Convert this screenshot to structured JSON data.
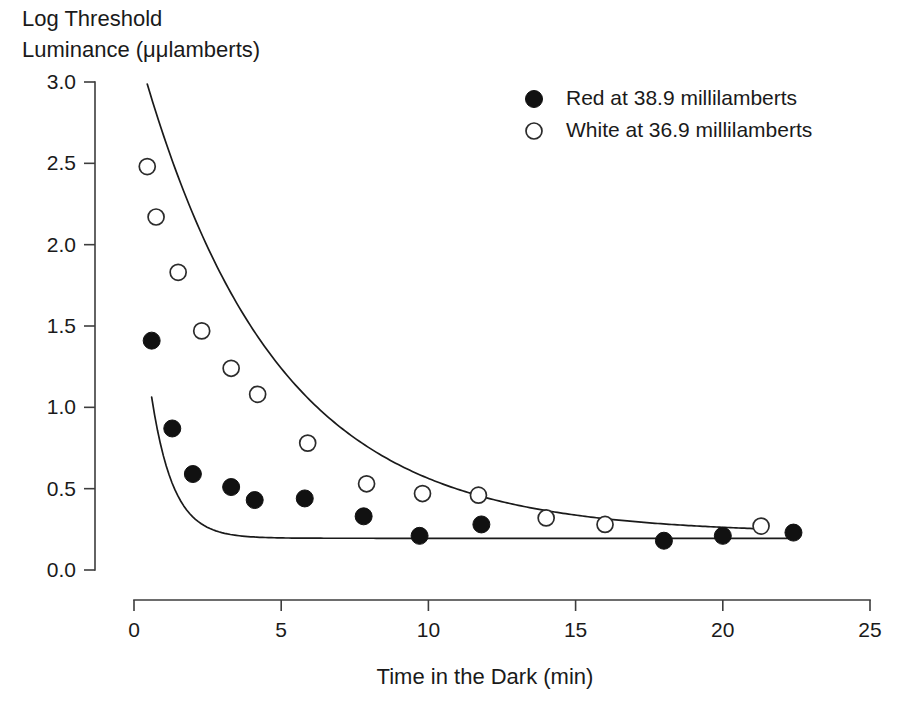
{
  "chart_data": {
    "type": "scatter",
    "title": "",
    "ylabel_line1": "Log Threshold",
    "ylabel_line2": "Luminance (μμlamberts)",
    "xlabel": "Time in the Dark (min)",
    "xlim": [
      0,
      25
    ],
    "ylim": [
      0,
      3.0
    ],
    "xticks": [
      0,
      5,
      10,
      15,
      20,
      25
    ],
    "yticks": [
      "0.0",
      "0.5",
      "1.0",
      "1.5",
      "2.0",
      "2.5",
      "3.0"
    ],
    "ytick_values": [
      0.0,
      0.5,
      1.0,
      1.5,
      2.0,
      2.5,
      3.0
    ],
    "grid": false,
    "legend_position": "top-right",
    "series": [
      {
        "name": "Red at 38.9 millilamberts",
        "marker": "filled-circle",
        "color": "#111111",
        "points": [
          {
            "x": 0.6,
            "y": 1.41
          },
          {
            "x": 1.3,
            "y": 0.87
          },
          {
            "x": 2.0,
            "y": 0.59
          },
          {
            "x": 3.3,
            "y": 0.51
          },
          {
            "x": 4.1,
            "y": 0.43
          },
          {
            "x": 5.8,
            "y": 0.44
          },
          {
            "x": 7.8,
            "y": 0.33
          },
          {
            "x": 9.7,
            "y": 0.21
          },
          {
            "x": 11.8,
            "y": 0.28
          },
          {
            "x": 18.0,
            "y": 0.18
          },
          {
            "x": 20.0,
            "y": 0.21
          },
          {
            "x": 22.4,
            "y": 0.23
          }
        ],
        "fit": {
          "a": 1.95,
          "k": 1.35,
          "c": 0.195
        }
      },
      {
        "name": "White at 36.9 millilamberts",
        "marker": "open-circle",
        "color": "#ffffff",
        "points": [
          {
            "x": 0.45,
            "y": 2.48
          },
          {
            "x": 0.75,
            "y": 2.17
          },
          {
            "x": 1.5,
            "y": 1.83
          },
          {
            "x": 2.3,
            "y": 1.47
          },
          {
            "x": 3.3,
            "y": 1.24
          },
          {
            "x": 4.2,
            "y": 1.08
          },
          {
            "x": 5.9,
            "y": 0.78
          },
          {
            "x": 7.9,
            "y": 0.53
          },
          {
            "x": 9.8,
            "y": 0.47
          },
          {
            "x": 11.7,
            "y": 0.46
          },
          {
            "x": 14.0,
            "y": 0.32
          },
          {
            "x": 16.0,
            "y": 0.28
          },
          {
            "x": 21.3,
            "y": 0.27
          }
        ],
        "fit": {
          "a": 3.05,
          "k": 0.22,
          "c": 0.225
        }
      }
    ],
    "legend": [
      {
        "label": "Red at 38.9 millilamberts",
        "marker": "filled-circle"
      },
      {
        "label": "White at 36.9 millilamberts",
        "marker": "open-circle"
      }
    ]
  }
}
